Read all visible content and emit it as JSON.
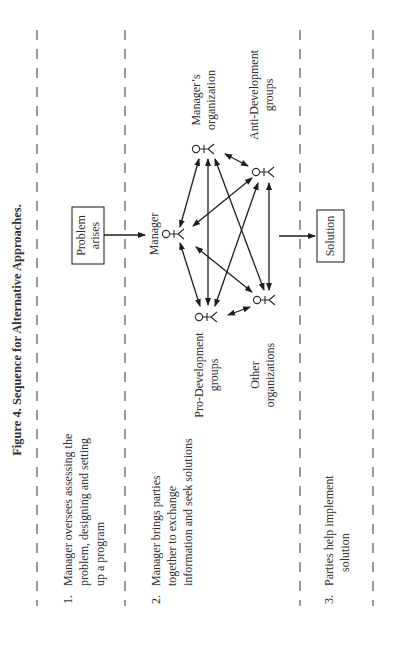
{
  "figure": {
    "title": "Figure 4. Sequence for Alternative Approaches.",
    "orientation": "rotated 90 degrees counter-clockwise"
  },
  "steps": [
    {
      "number": "1.",
      "lines": [
        "Manager oversees assessing the",
        "problem, designing and setting",
        "up a program"
      ]
    },
    {
      "number": "2.",
      "lines": [
        "Manager brings parties",
        "together to exchange",
        "information and seek solutions"
      ]
    },
    {
      "number": "3.",
      "lines": [
        "Parties help implement",
        "solution"
      ]
    }
  ],
  "boxes": {
    "problem": {
      "lines": [
        "Problem",
        "arises"
      ]
    },
    "solution": {
      "lines": [
        "Solution"
      ]
    }
  },
  "actors": {
    "manager": {
      "label": "Manager"
    },
    "managers_org": {
      "lines": [
        "Manager’s",
        "organization"
      ]
    },
    "anti_dev": {
      "lines": [
        "Anti-Development",
        "groups"
      ]
    },
    "pro_dev": {
      "lines": [
        "Pro-Development",
        "groups"
      ]
    },
    "other_orgs": {
      "lines": [
        "Other",
        "organizations"
      ]
    }
  },
  "connections": [
    {
      "from": "problem",
      "to": "manager",
      "type": "arrow"
    },
    {
      "from": "manager",
      "to": "solution",
      "type": "arrow"
    },
    {
      "from": "manager",
      "to": "managers_org",
      "type": "double-arrow"
    },
    {
      "from": "manager",
      "to": "anti_dev",
      "type": "double-arrow"
    },
    {
      "from": "manager",
      "to": "pro_dev",
      "type": "double-arrow"
    },
    {
      "from": "manager",
      "to": "other_orgs",
      "type": "double-arrow"
    },
    {
      "from": "managers_org",
      "to": "anti_dev",
      "type": "double-arrow"
    },
    {
      "from": "managers_org",
      "to": "pro_dev",
      "type": "double-arrow"
    },
    {
      "from": "managers_org",
      "to": "other_orgs",
      "type": "double-arrow"
    },
    {
      "from": "anti_dev",
      "to": "pro_dev",
      "type": "double-arrow"
    },
    {
      "from": "anti_dev",
      "to": "other_orgs",
      "type": "double-arrow"
    },
    {
      "from": "pro_dev",
      "to": "other_orgs",
      "type": "double-arrow"
    }
  ]
}
